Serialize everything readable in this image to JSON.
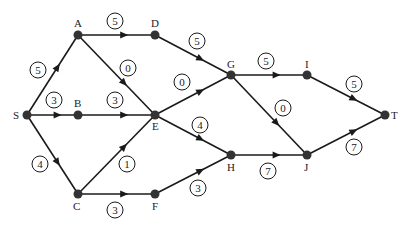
{
  "diagram": {
    "type": "directed-network",
    "colors": {
      "line": "#1a1a1a",
      "node": "#333333",
      "text": "#222222",
      "background": "#ffffff"
    },
    "nodes": [
      {
        "id": "S",
        "label": "S",
        "x": 27,
        "y": 115,
        "lx": 13,
        "ly": 119
      },
      {
        "id": "A",
        "label": "A",
        "x": 78,
        "y": 35,
        "lx": 74,
        "ly": 27
      },
      {
        "id": "B",
        "label": "B",
        "x": 78,
        "y": 115,
        "lx": 74,
        "ly": 107
      },
      {
        "id": "C",
        "label": "C",
        "x": 78,
        "y": 194,
        "lx": 73,
        "ly": 210
      },
      {
        "id": "D",
        "label": "D",
        "x": 155,
        "y": 35,
        "lx": 151,
        "ly": 27
      },
      {
        "id": "E",
        "label": "E",
        "x": 155,
        "y": 115,
        "lx": 152,
        "ly": 130
      },
      {
        "id": "F",
        "label": "F",
        "x": 155,
        "y": 194,
        "lx": 152,
        "ly": 210
      },
      {
        "id": "G",
        "label": "G",
        "x": 231,
        "y": 75,
        "lx": 227,
        "ly": 68
      },
      {
        "id": "H",
        "label": "H",
        "x": 231,
        "y": 155,
        "lx": 227,
        "ly": 171
      },
      {
        "id": "I",
        "label": "I",
        "x": 307,
        "y": 75,
        "lx": 305,
        "ly": 68
      },
      {
        "id": "J",
        "label": "J",
        "x": 307,
        "y": 155,
        "lx": 304,
        "ly": 171
      },
      {
        "id": "T",
        "label": "T",
        "x": 385,
        "y": 115,
        "lx": 391,
        "ly": 119
      }
    ],
    "edges": [
      {
        "from": "S",
        "to": "A",
        "weight": "5",
        "wx": 38,
        "wy": 70
      },
      {
        "from": "S",
        "to": "B",
        "weight": "3",
        "wx": 54,
        "wy": 100
      },
      {
        "from": "S",
        "to": "C",
        "weight": "4",
        "wx": 40,
        "wy": 164
      },
      {
        "from": "A",
        "to": "D",
        "weight": "5",
        "wx": 115,
        "wy": 21
      },
      {
        "from": "A",
        "to": "E",
        "weight": "0",
        "wx": 128,
        "wy": 68
      },
      {
        "from": "B",
        "to": "E",
        "weight": "3",
        "wx": 115,
        "wy": 100
      },
      {
        "from": "C",
        "to": "E",
        "weight": "1",
        "wx": 127,
        "wy": 164
      },
      {
        "from": "C",
        "to": "F",
        "weight": "3",
        "wx": 115,
        "wy": 210
      },
      {
        "from": "D",
        "to": "G",
        "weight": "5",
        "wx": 197,
        "wy": 41
      },
      {
        "from": "E",
        "to": "G",
        "weight": "0",
        "wx": 182,
        "wy": 82
      },
      {
        "from": "E",
        "to": "H",
        "weight": "4",
        "wx": 200,
        "wy": 125
      },
      {
        "from": "F",
        "to": "H",
        "weight": "3",
        "wx": 198,
        "wy": 188
      },
      {
        "from": "G",
        "to": "I",
        "weight": "5",
        "wx": 266,
        "wy": 61
      },
      {
        "from": "G",
        "to": "J",
        "weight": "0",
        "wx": 283,
        "wy": 108
      },
      {
        "from": "H",
        "to": "J",
        "weight": "7",
        "wx": 268,
        "wy": 171
      },
      {
        "from": "I",
        "to": "T",
        "weight": "5",
        "wx": 354,
        "wy": 84
      },
      {
        "from": "J",
        "to": "T",
        "weight": "7",
        "wx": 354,
        "wy": 147
      }
    ]
  }
}
